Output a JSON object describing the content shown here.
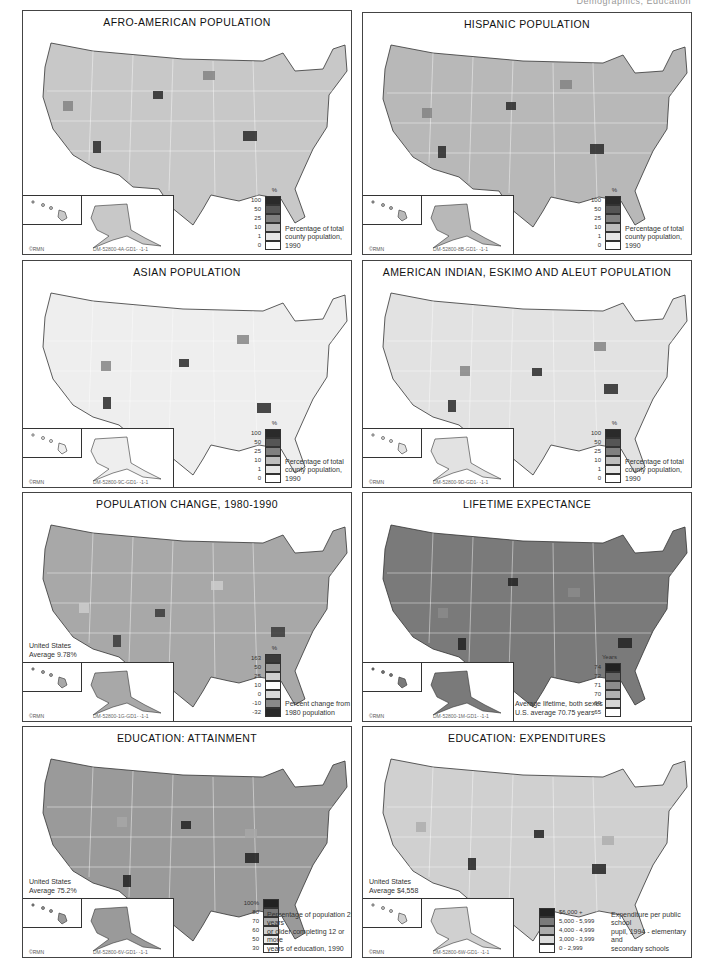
{
  "page": {
    "running_header": "Demographics, Education"
  },
  "panels": [
    {
      "id": "afro-american",
      "title": "AFRO-AMERICAN POPULATION",
      "credit": "©RMN",
      "code": "DM-52800-4A-GD1- -1-1",
      "legend_unit": "%",
      "legend": [
        {
          "label": "100",
          "color": "#2a2a2a"
        },
        {
          "label": "50",
          "color": "#555555"
        },
        {
          "label": "25",
          "color": "#808080"
        },
        {
          "label": "10",
          "color": "#bdbdbd"
        },
        {
          "label": "1",
          "color": "#e6e6e6"
        },
        {
          "label": "0",
          "color": "#ffffff"
        }
      ],
      "caption": [
        "Percentage of total",
        "county population, 1990"
      ],
      "map_tone": "#c8c8c8",
      "average": null
    },
    {
      "id": "hispanic",
      "title": "HISPANIC POPULATION",
      "credit": "©RMN",
      "code": "DM-52800-8B-GD1- -1-1",
      "legend_unit": "%",
      "legend": [
        {
          "label": "100",
          "color": "#2a2a2a"
        },
        {
          "label": "50",
          "color": "#555555"
        },
        {
          "label": "25",
          "color": "#808080"
        },
        {
          "label": "10",
          "color": "#bdbdbd"
        },
        {
          "label": "1",
          "color": "#e6e6e6"
        },
        {
          "label": "0",
          "color": "#ffffff"
        }
      ],
      "caption": [
        "Percentage of total",
        "county population, 1990"
      ],
      "map_tone": "#b8b8b8",
      "average": null
    },
    {
      "id": "asian",
      "title": "ASIAN POPULATION",
      "credit": "©RMN",
      "code": "DM-52800-9C-GD1- -1-1",
      "legend_unit": "%",
      "legend": [
        {
          "label": "100",
          "color": "#2a2a2a"
        },
        {
          "label": "50",
          "color": "#555555"
        },
        {
          "label": "25",
          "color": "#808080"
        },
        {
          "label": "10",
          "color": "#bdbdbd"
        },
        {
          "label": "1",
          "color": "#e6e6e6"
        },
        {
          "label": "0",
          "color": "#ffffff"
        }
      ],
      "caption": [
        "Percentage of total",
        "county population, 1990"
      ],
      "map_tone": "#eeeeee",
      "average": null
    },
    {
      "id": "american-indian",
      "title": "AMERICAN INDIAN, ESKIMO AND ALEUT POPULATION",
      "credit": "©RMN",
      "code": "DM-52800-9D-GD1- -1-1",
      "legend_unit": "%",
      "legend": [
        {
          "label": "100",
          "color": "#2a2a2a"
        },
        {
          "label": "50",
          "color": "#555555"
        },
        {
          "label": "25",
          "color": "#808080"
        },
        {
          "label": "10",
          "color": "#bdbdbd"
        },
        {
          "label": "1",
          "color": "#e6e6e6"
        },
        {
          "label": "0",
          "color": "#ffffff"
        }
      ],
      "caption": [
        "Percentage of total",
        "county population, 1990"
      ],
      "map_tone": "#e2e2e2",
      "average": null
    },
    {
      "id": "population-change",
      "title": "POPULATION CHANGE, 1980-1990",
      "credit": "©RMN",
      "code": "DM-52800-1G-GD1- -1-1",
      "legend_unit": "%",
      "legend": [
        {
          "label": "163",
          "color": "#3a3a3a"
        },
        {
          "label": "50",
          "color": "#9a9a9a"
        },
        {
          "label": "25",
          "color": "#cfcfcf"
        },
        {
          "label": "10",
          "color": "#ffffff"
        },
        {
          "label": "0",
          "color": "#d8d8d8"
        },
        {
          "label": "-10",
          "color": "#8a8a8a"
        },
        {
          "label": "-32",
          "color": "#2a2a2a"
        }
      ],
      "caption": [
        "Percent change from",
        "1980 population"
      ],
      "map_tone": "#a8a8a8",
      "average": [
        "United States",
        "Average 9.78%"
      ]
    },
    {
      "id": "lifetime-expectance",
      "title": "LIFETIME EXPECTANCE",
      "credit": "©RMN",
      "code": "DM-52800-1M-GD1- -1-1",
      "legend_unit": "Years",
      "legend": [
        {
          "label": "74",
          "color": "#222222"
        },
        {
          "label": "72",
          "color": "#666666"
        },
        {
          "label": "71",
          "color": "#8c8c8c"
        },
        {
          "label": "70",
          "color": "#b0b0b0"
        },
        {
          "label": "69",
          "color": "#d6d6d6"
        },
        {
          "label": "65",
          "color": "#ffffff"
        }
      ],
      "caption": [
        "Average lifetime, both sexes",
        "U.S. average 70.75 years"
      ],
      "map_tone": "#7a7a7a",
      "average": null
    },
    {
      "id": "education-attainment",
      "title": "EDUCATION: ATTAINMENT",
      "credit": "©RMN",
      "code": "DM-52800-6V-GD1- -1-1",
      "legend_unit": "",
      "legend": [
        {
          "label": "100%",
          "color": "#222222"
        },
        {
          "label": "80",
          "color": "#777777"
        },
        {
          "label": "70",
          "color": "#a8a8a8"
        },
        {
          "label": "60",
          "color": "#cfcfcf"
        },
        {
          "label": "50",
          "color": "#ececec"
        },
        {
          "label": "30",
          "color": "#ffffff"
        }
      ],
      "caption": [
        "Percentage of population 25 years",
        "or older completing 12 or more",
        "years of education, 1990"
      ],
      "map_tone": "#9a9a9a",
      "average": [
        "United States",
        "Average 75.2%"
      ]
    },
    {
      "id": "education-expenditures",
      "title": "EDUCATION: EXPENDITURES",
      "credit": "©RMN",
      "code": "DM-52800-6W-GD1- -1-1",
      "legend_unit": "",
      "legend": [
        {
          "label": "$6,000 +",
          "color": "#222222"
        },
        {
          "label": "5,000 - 5,999",
          "color": "#7a7a7a"
        },
        {
          "label": "4,000 - 4,999",
          "color": "#ababab"
        },
        {
          "label": "3,000 - 3,999",
          "color": "#dcdcdc"
        },
        {
          "label": "0 - 2,999",
          "color": "#ffffff"
        }
      ],
      "caption": [
        "Expenditure per public school",
        "pupil, 1994 - elementary and",
        "secondary schools"
      ],
      "map_tone": "#d0d0d0",
      "average": [
        "United States",
        "Average $4,558"
      ]
    }
  ]
}
